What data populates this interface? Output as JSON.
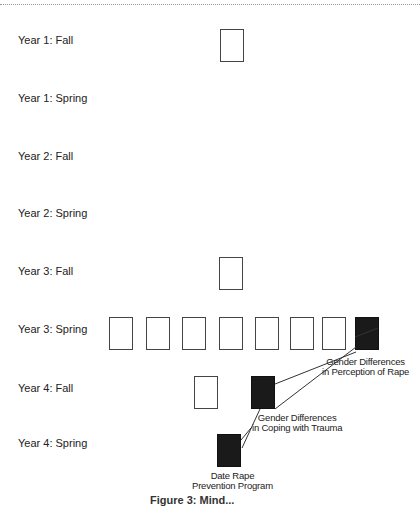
{
  "rows": [
    {
      "label": "Year 1:  Fall"
    },
    {
      "label": "Year 1:  Spring"
    },
    {
      "label": "Year 2:  Fall"
    },
    {
      "label": "Year 2:  Spring"
    },
    {
      "label": "Year 3:  Fall"
    },
    {
      "label": "Year 3:  Spring"
    },
    {
      "label": "Year 4:  Fall"
    },
    {
      "label": "Year 4:  Spring"
    }
  ],
  "notes": {
    "perception": {
      "line1": "Gender Differences",
      "line2": "in Perception of Rape"
    },
    "coping": {
      "line1": "Gender Differences",
      "line2": "in Coping with Trauma"
    },
    "prevention": {
      "line1": "Date Rape",
      "line2": "Prevention Program"
    }
  },
  "caption": "Figure 3: Mind..."
}
